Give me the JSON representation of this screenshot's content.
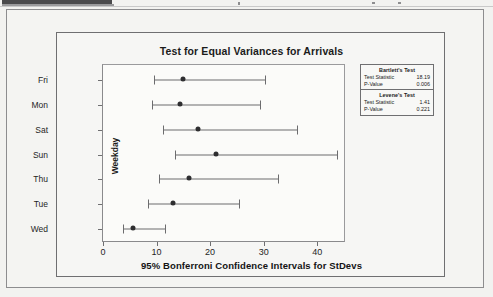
{
  "document": {
    "top_bar_name": "clipped-toolbar-strip"
  },
  "chart_data": {
    "type": "interval",
    "title": "Test for Equal Variances for Arrivals",
    "xlabel": "95% Bonferroni Confidence Intervals for StDevs",
    "ylabel": "Weekday",
    "categories": [
      "Fri",
      "Mon",
      "Sat",
      "Sun",
      "Thu",
      "Tue",
      "Wed"
    ],
    "xlim": [
      0,
      45
    ],
    "xticks": [
      0,
      10,
      20,
      30,
      40
    ],
    "xtick_labels": [
      "0",
      "10",
      "20",
      "30",
      "40"
    ],
    "grid": false,
    "legend_position": "right",
    "intervals": [
      {
        "category": "Fri",
        "lower": 9.4,
        "center": 14.8,
        "upper": 30.0
      },
      {
        "category": "Mon",
        "lower": 9.0,
        "center": 14.2,
        "upper": 29.2
      },
      {
        "category": "Sat",
        "lower": 11.0,
        "center": 17.5,
        "upper": 36.0
      },
      {
        "category": "Sun",
        "lower": 13.3,
        "center": 21.0,
        "upper": 43.5
      },
      {
        "category": "Thu",
        "lower": 10.2,
        "center": 15.8,
        "upper": 32.4
      },
      {
        "category": "Tue",
        "lower": 8.3,
        "center": 12.8,
        "upper": 25.3
      },
      {
        "category": "Wed",
        "lower": 3.5,
        "center": 5.5,
        "upper": 11.3
      }
    ],
    "annotations": {
      "tests": [
        {
          "name": "Bartlett's Test",
          "rows": [
            {
              "label": "Test Statistic",
              "value": "18.19"
            },
            {
              "label": "P-Value",
              "value": "0.006"
            }
          ]
        },
        {
          "name": "Levene's Test",
          "rows": [
            {
              "label": "Test Statistic",
              "value": "1.41"
            },
            {
              "label": "P-Value",
              "value": "0.221"
            }
          ]
        }
      ]
    }
  },
  "colors": {
    "page_background": "#f2f2f0",
    "plot_background": "#fbfbf9",
    "frame_border": "#8d8d8f",
    "axis": "#6f6f71",
    "interval_line": "#6c6c6e",
    "marker": "#2e2e30",
    "text": "#1b1b1b",
    "top_bar": "#4a4a4c"
  }
}
